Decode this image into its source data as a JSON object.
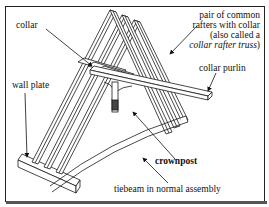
{
  "figure": {
    "labels": {
      "collar": "collar",
      "wall_plate": "wall plate",
      "pair_line1": "pair of common",
      "pair_line2": "rafters with collar",
      "pair_line3": "(also called a",
      "pair_line4_italic": "collar rafter truss",
      "pair_line4_close": ")",
      "collar_purlin": "collar purlin",
      "crownpost": "crownpost",
      "tiebeam": "tiebeam in normal assembly"
    },
    "colors": {
      "line": "#1a1a1a",
      "background": "#ffffff",
      "text": "#111111"
    }
  }
}
